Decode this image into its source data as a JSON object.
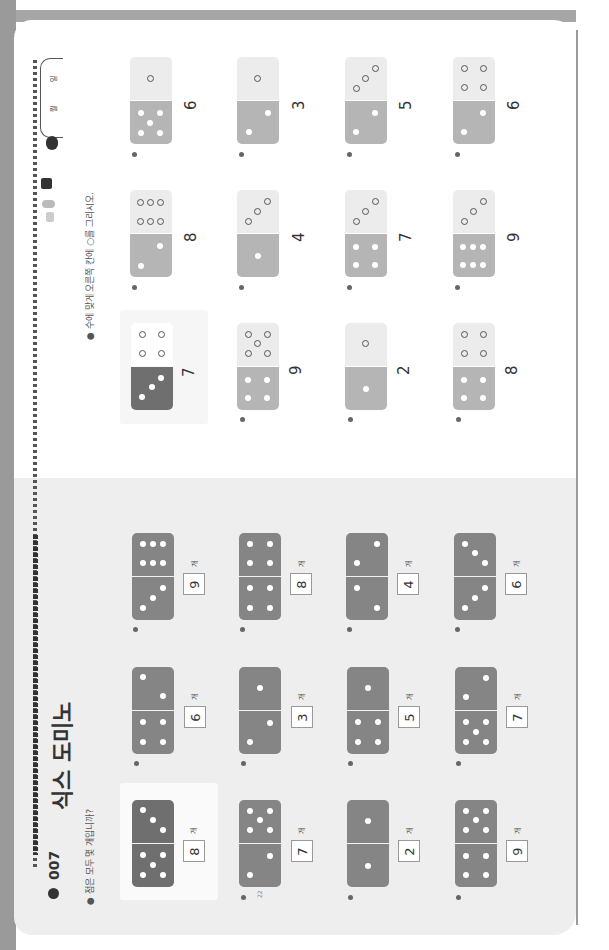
{
  "orientation": "rotated 90deg counter-clockwise scan of two-page workbook spread",
  "colors": {
    "domino_dark": "#707070",
    "domino_mid": "#9a9a9a",
    "domino_light_bottom": "#b0b0b0",
    "domino_light_top": "#ececec",
    "left_page_bg": "#eeeeee",
    "right_page_bg": "#ffffff",
    "edge_strip": "#9a9a9a"
  },
  "left_page": {
    "lesson_number": "007",
    "title": "식스 도미노",
    "instruction": "점은 모두 몇 개입니까?",
    "page_number": "22",
    "unit_label": "개",
    "items": [
      {
        "index": "example",
        "top_pips": 3,
        "bottom_pips": 5,
        "answer": "8"
      },
      {
        "index": "1",
        "top_pips": 2,
        "bottom_pips": 4,
        "answer": "6"
      },
      {
        "index": "2",
        "top_pips": 6,
        "bottom_pips": 3,
        "answer": "9"
      },
      {
        "index": "3",
        "top_pips": 5,
        "bottom_pips": 2,
        "answer": "7"
      },
      {
        "index": "4",
        "top_pips": 1,
        "bottom_pips": 2,
        "answer": "3"
      },
      {
        "index": "5",
        "top_pips": 4,
        "bottom_pips": 4,
        "answer": "8"
      },
      {
        "index": "6",
        "top_pips": 1,
        "bottom_pips": 1,
        "answer": "2"
      },
      {
        "index": "7",
        "top_pips": 1,
        "bottom_pips": 4,
        "answer": "5"
      },
      {
        "index": "8",
        "top_pips": 2,
        "bottom_pips": 2,
        "answer": "4"
      },
      {
        "index": "9",
        "top_pips": 5,
        "bottom_pips": 4,
        "answer": "9"
      },
      {
        "index": "10",
        "top_pips": 2,
        "bottom_pips": 5,
        "answer": "7"
      },
      {
        "index": "11",
        "top_pips": 3,
        "bottom_pips": 3,
        "answer": "6"
      }
    ]
  },
  "right_page": {
    "instruction": "수에 맞게 오른쪽 칸에 ○를 그리시오.",
    "page_footer": "시그널 · 23",
    "date_labels": {
      "month": "월",
      "day": "일"
    },
    "items": [
      {
        "index": "example",
        "filled_pips": 3,
        "drawn_rings": 4,
        "target": "7"
      },
      {
        "index": "1",
        "filled_pips": 4,
        "drawn_rings": 5,
        "target": "9"
      },
      {
        "index": "2",
        "filled_pips": 1,
        "drawn_rings": 1,
        "target": "2"
      },
      {
        "index": "3",
        "filled_pips": 4,
        "drawn_rings": 4,
        "target": "8"
      },
      {
        "index": "4",
        "filled_pips": 2,
        "drawn_rings": 6,
        "target": "8"
      },
      {
        "index": "5",
        "filled_pips": 1,
        "drawn_rings": 3,
        "target": "4"
      },
      {
        "index": "6",
        "filled_pips": 4,
        "drawn_rings": 3,
        "target": "7"
      },
      {
        "index": "7",
        "filled_pips": 6,
        "drawn_rings": 3,
        "target": "9"
      },
      {
        "index": "8",
        "filled_pips": 5,
        "drawn_rings": 1,
        "target": "6"
      },
      {
        "index": "9",
        "filled_pips": 2,
        "drawn_rings": 1,
        "target": "3"
      },
      {
        "index": "10",
        "filled_pips": 2,
        "drawn_rings": 3,
        "target": "5"
      },
      {
        "index": "11",
        "filled_pips": 2,
        "drawn_rings": 4,
        "target": "6"
      }
    ]
  }
}
